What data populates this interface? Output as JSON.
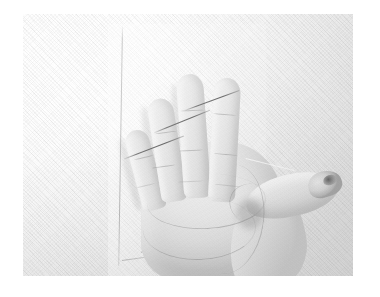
{
  "image": {
    "kind": "photograph",
    "title": "Open palm against white textile backdrop",
    "tone": "black-and-white high-key",
    "orientation": "landscape",
    "canvas": {
      "width": 380,
      "height": 297,
      "background": "#ffffff"
    },
    "photo_area": {
      "left": 23,
      "top": 14,
      "width": 330,
      "height": 262
    }
  },
  "palette": {
    "page_background": "#ffffff",
    "backdrop_light": "#fdfdfd",
    "backdrop_mid": "#efefef",
    "backdrop_dark": "#dcdcdc",
    "skin_highlight": "#f0f0f0",
    "skin_mid": "#e2e2e2",
    "skin_shadow": "#c4c4c4",
    "crease_line": "#787878",
    "pin_line": "#4a4a4a",
    "sheet_edge": "#8c8c8c"
  },
  "subjects": {
    "hand": {
      "label": "open left hand, palm facing camera",
      "fingers": [
        {
          "name": "little-finger",
          "label": "little finger"
        },
        {
          "name": "ring-finger",
          "label": "ring finger"
        },
        {
          "name": "index-finger",
          "label": "index finger"
        },
        {
          "name": "middle-finger",
          "label": "middle finger"
        },
        {
          "name": "thumb",
          "label": "thumb, extended to the right"
        }
      ],
      "features": [
        "palm creases",
        "finger joint creases",
        "thenar eminence",
        "thumb nail"
      ]
    },
    "backdrop": {
      "label": "white woven textile wall",
      "texture": "fine diagonal cross-hatch weave"
    },
    "sheet": {
      "label": "transparent acrylic sheet leaning behind the hand",
      "visible_edges": [
        "vertical left edge",
        "lower-left corner"
      ]
    },
    "pins": {
      "label": "thin straight pins crossing the fingertips",
      "count": 3,
      "note": "dark hairline segments angled up-to-the-right"
    }
  }
}
